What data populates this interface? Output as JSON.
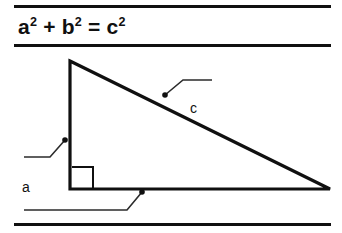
{
  "figure": {
    "formula": {
      "base_a": "a",
      "exp_a": "2",
      "plus": "+",
      "base_b": "b",
      "exp_b": "2",
      "equals": "=",
      "base_c": "c",
      "exp_c": "2",
      "plain_text": "a2 + b2 = c2"
    },
    "labels": {
      "a": "a",
      "b": "b",
      "c": "c"
    },
    "colors": {
      "ink": "#101010",
      "background": "#ffffff",
      "leader": "#2b2b2b"
    },
    "shape": {
      "kind": "right-triangle",
      "apex": [
        70,
        16
      ],
      "right_angle_corner": [
        70,
        144
      ],
      "far_corner": [
        330,
        144
      ],
      "right_angle_marker": true
    }
  }
}
